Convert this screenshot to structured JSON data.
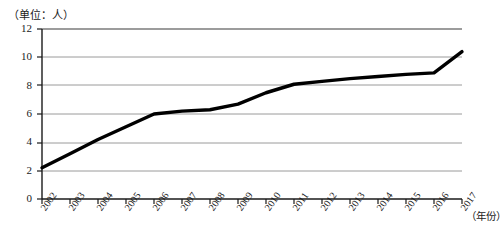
{
  "chart_data": {
    "type": "line",
    "title": "",
    "subtitle": "",
    "unit_label": "（单位：人）",
    "xlabel": "（年份）",
    "ylabel": "",
    "categories": [
      "2002",
      "2003",
      "2004",
      "2005",
      "2006",
      "2007",
      "2008",
      "2009",
      "2010",
      "2011",
      "2012",
      "2013",
      "2014",
      "2015",
      "2016",
      "2017"
    ],
    "values": [
      2.2,
      3.2,
      4.2,
      5.1,
      6.0,
      6.2,
      6.3,
      6.7,
      7.5,
      8.1,
      8.3,
      8.5,
      8.65,
      8.8,
      8.9,
      10.4
    ],
    "series": [
      {
        "name": "人数",
        "values": [
          2.2,
          3.2,
          4.2,
          5.1,
          6.0,
          6.2,
          6.3,
          6.7,
          7.5,
          8.1,
          8.3,
          8.5,
          8.65,
          8.8,
          8.9,
          10.4
        ]
      }
    ],
    "yticks": [
      0,
      2,
      4,
      6,
      8,
      10,
      12
    ],
    "ytick_labels": [
      "0",
      "2",
      "4",
      "6",
      "8",
      "10",
      "12"
    ],
    "ylim": [
      0,
      12
    ],
    "xlim": [
      "2002",
      "2017"
    ],
    "grid": "horizontal",
    "legend": "none",
    "line_color": "#000000",
    "grid_color": "#9a9a9a",
    "axis_color": "#1a1a1a",
    "background_color": "#ffffff"
  }
}
